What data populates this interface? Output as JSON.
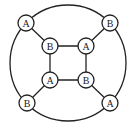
{
  "diagram": {
    "outer_circle": {
      "cx": 68,
      "cy": 63,
      "r": 58
    },
    "node_radius": 8,
    "nodes": [
      {
        "id": "outer-tl",
        "label": "A",
        "x": 26,
        "y": 23
      },
      {
        "id": "outer-tr",
        "label": "B",
        "x": 110,
        "y": 23
      },
      {
        "id": "outer-bl",
        "label": "B",
        "x": 27,
        "y": 103
      },
      {
        "id": "outer-br",
        "label": "A",
        "x": 110,
        "y": 103
      },
      {
        "id": "inner-tl",
        "label": "B",
        "x": 50,
        "y": 46
      },
      {
        "id": "inner-tr",
        "label": "A",
        "x": 86,
        "y": 46
      },
      {
        "id": "inner-bl",
        "label": "A",
        "x": 50,
        "y": 80
      },
      {
        "id": "inner-br",
        "label": "B",
        "x": 86,
        "y": 80
      }
    ],
    "edges": [
      [
        "inner-tl",
        "inner-tr"
      ],
      [
        "inner-tr",
        "inner-br"
      ],
      [
        "inner-br",
        "inner-bl"
      ],
      [
        "inner-bl",
        "inner-tl"
      ],
      [
        "outer-tl",
        "inner-tl"
      ],
      [
        "outer-tr",
        "inner-tr"
      ],
      [
        "outer-bl",
        "inner-bl"
      ],
      [
        "outer-br",
        "inner-br"
      ]
    ],
    "stroke_color": "#222222"
  }
}
